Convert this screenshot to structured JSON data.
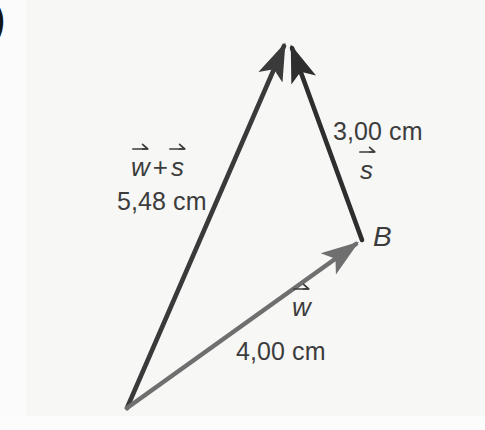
{
  "figure": {
    "title_mark": ")",
    "background_color": "#f8f8f7",
    "labels": {
      "sum_vector_symbol_first": "w",
      "sum_vector_operator": "+",
      "sum_vector_symbol_second": "s",
      "sum_magnitude": "5,48 cm",
      "s_magnitude": "3,00 cm",
      "s_symbol": "s",
      "w_symbol": "w",
      "w_magnitude": "4,00 cm",
      "point_b": "B"
    },
    "colors": {
      "vector_sum_stroke": "#3a3a3a",
      "vector_s_stroke": "#2e2e2e",
      "vector_w_stroke": "#757575",
      "text": "#3c3c3c",
      "point_label": "#1b1b1b"
    },
    "geometry": {
      "origin": {
        "x": 127,
        "y": 408
      },
      "apex": {
        "x": 287,
        "y": 36
      },
      "point_b": {
        "x": 362,
        "y": 240
      },
      "vector_sum": {
        "from": "origin",
        "to": "apex",
        "magnitude_cm": 5.48
      },
      "vector_w": {
        "from": "origin",
        "to": "point_b",
        "magnitude_cm": 4.0
      },
      "vector_s": {
        "from": "point_b",
        "to": "apex",
        "magnitude_cm": 3.0
      }
    }
  }
}
